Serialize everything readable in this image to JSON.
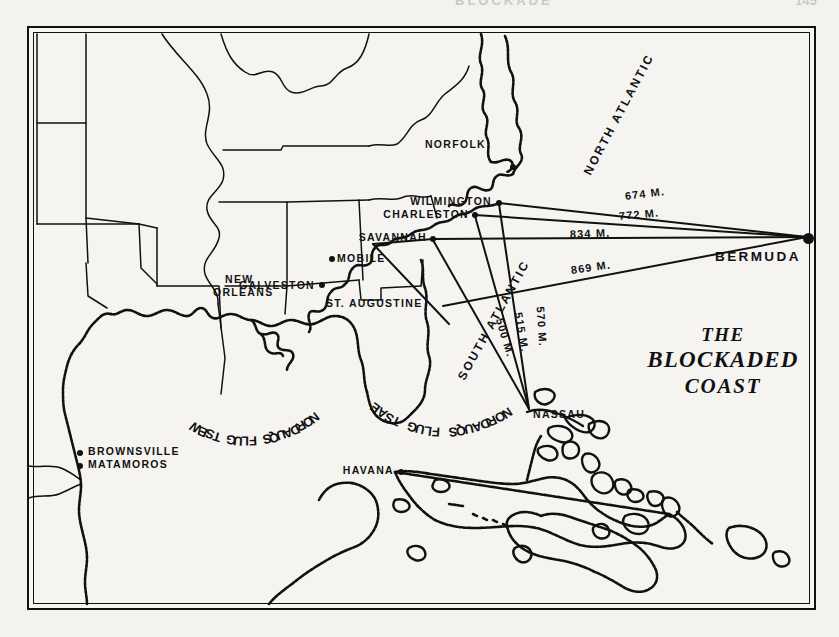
{
  "page": {
    "running_head_title": "BLOCKADE",
    "running_head_folio": "145"
  },
  "map": {
    "title_line1": "THE",
    "title_line2": "BLOCKADED",
    "title_line3": "COAST",
    "ink_color": "#111111",
    "paper_color": "#f3f2ef"
  },
  "cities": [
    {
      "name": "NORFOLK",
      "x": 484,
      "y": 115
    },
    {
      "name": "WILMINGTON",
      "x": 424,
      "y": 182
    },
    {
      "name": "CHARLESTON",
      "x": 396,
      "y": 209
    },
    {
      "name": "SAVANNAH",
      "x": 374,
      "y": 230
    },
    {
      "name": "MOBILE",
      "x": 336,
      "y": 256
    },
    {
      "name": "ST. AUGUSTINE",
      "x": 330,
      "y": 298
    },
    {
      "name": "NEW",
      "x": 227,
      "y": 275
    },
    {
      "name": "ORLEANS",
      "x": 215,
      "y": 287
    },
    {
      "name": "GALVESTON",
      "x": 60,
      "y": 281
    },
    {
      "name": "BROWNSVILLE",
      "x": 85,
      "y": 437
    },
    {
      "name": "MATAMOROS",
      "x": 85,
      "y": 450
    },
    {
      "name": "HAVANA",
      "x": 360,
      "y": 440
    },
    {
      "name": "NASSAU",
      "x": 533,
      "y": 400
    },
    {
      "name": "BERMUDA",
      "x": 716,
      "y": 251
    }
  ],
  "ocean_labels": [
    {
      "name": "NORTH ATLANTIC",
      "x": 576,
      "y": 160,
      "rotation": -62
    },
    {
      "name": "SOUTH ATLANTIC",
      "x": 455,
      "y": 330,
      "rotation": -61
    }
  ],
  "squadron_labels": [
    {
      "name": "WEST GULF SQUADRON",
      "x": 118,
      "y": 400
    },
    {
      "name": "EAST GULF SQUADRON",
      "x": 345,
      "y": 355
    }
  ],
  "distance_lines": [
    {
      "label": "674 M.",
      "from": "Wilmington",
      "to": "Bermuda",
      "miles": 674,
      "label_x": 625,
      "label_y": 193
    },
    {
      "label": "772 M.",
      "from": "Charleston",
      "to": "Bermuda",
      "miles": 772,
      "label_x": 618,
      "label_y": 212
    },
    {
      "label": "834 M.",
      "from": "Savannah",
      "to": "Bermuda",
      "miles": 834,
      "label_x": 570,
      "label_y": 230
    },
    {
      "label": "869 M.",
      "from": "St. Augustine",
      "to": "Bermuda",
      "miles": 869,
      "label_x": 571,
      "label_y": 266
    },
    {
      "label": "500 M.",
      "from": "Charleston",
      "to": "Nassau",
      "miles": 500,
      "label_x": 498,
      "label_y": 318
    },
    {
      "label": "515 M.",
      "from": "Savannah",
      "to": "Nassau",
      "miles": 515,
      "label_x": 516,
      "label_y": 312
    },
    {
      "label": "570 M.",
      "from": "Wilmington",
      "to": "Nassau",
      "miles": 570,
      "label_x": 538,
      "label_y": 306
    }
  ]
}
